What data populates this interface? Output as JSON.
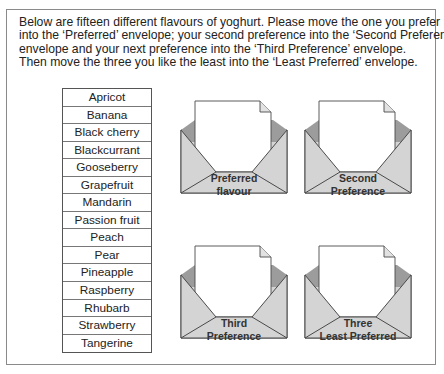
{
  "instructions": {
    "lines": [
      "Below are fifteen different flavours of yoghurt. Please move the one you prefer most",
      "into the ‘Preferred’ envelope; your second preference into the ‘Second Preference’",
      "envelope and your next preference into the ‘Third Preference’ envelope.",
      "Then move the three you like the least into the ‘Least Preferred’ envelope."
    ]
  },
  "flavours": [
    "Apricot",
    "Banana",
    "Black cherry",
    "Blackcurrant",
    "Gooseberry",
    "Grapefruit",
    "Mandarin",
    "Passion fruit",
    "Peach",
    "Pear",
    "Pineapple",
    "Raspberry",
    "Rhubarb",
    "Strawberry",
    "Tangerine"
  ],
  "envelopes": [
    {
      "line1": "Preferred",
      "line2": "flavour"
    },
    {
      "line1": "Second",
      "line2": "Preference"
    },
    {
      "line1": "Third",
      "line2": "Preference"
    },
    {
      "line1": "Three",
      "line2": "Least Preferred"
    }
  ],
  "colors": {
    "envelope_fill": "#d4d4d4",
    "envelope_inner": "#9c9c9c",
    "envelope_stroke": "#4a4a4a",
    "letter_fill": "#ffffff"
  }
}
